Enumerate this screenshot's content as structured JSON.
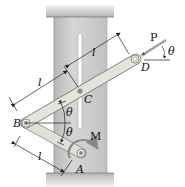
{
  "figure": {
    "type": "mechanism-diagram"
  },
  "labels": {
    "point_A": "A",
    "point_B": "B",
    "point_C": "C",
    "point_D": "D",
    "force_P": "P",
    "moment_M": "M",
    "angle_upper": "θ",
    "angle_lower": "θ",
    "angle_P": "θ",
    "length_BC": "l",
    "length_CD": "l",
    "length_AB": "l"
  },
  "colors": {
    "column": "#c9c9c9",
    "column_edge": "#9a9a9a",
    "wall": "#bdbdbd",
    "bar": "#e2e2d8",
    "bar_edge": "#8a8a80",
    "slot": "#ffffff",
    "moment_arrow": "#8a8a8a",
    "force_arrow": "#c8c8c8"
  }
}
